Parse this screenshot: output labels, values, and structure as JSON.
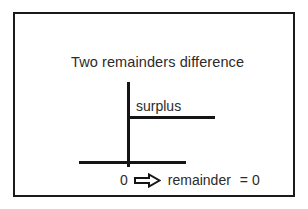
{
  "diagram": {
    "title": "Two remainders difference",
    "surplus_label": "surplus",
    "bottom": {
      "start_value": "0",
      "arrow_icon": "right-block-arrow-icon",
      "term": "remainder",
      "equals": "=",
      "result_value": "0"
    },
    "colors": {
      "frame": "#1a1a1a",
      "line": "#141414",
      "text": "#2b2b2b",
      "background": "#ffffff"
    }
  }
}
